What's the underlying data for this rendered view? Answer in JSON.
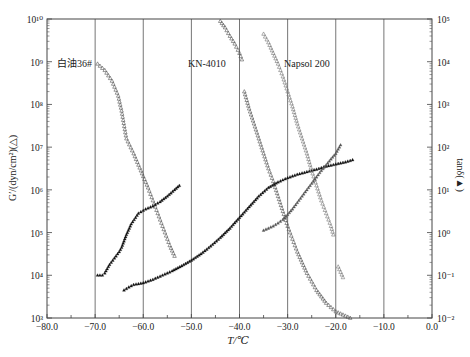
{
  "chart_data": {
    "type": "scatter",
    "title": "",
    "xlabel": "T/℃",
    "ylabel_left": "G′/(dyn/cm²)(△)",
    "ylabel_right": "tanδ(▲)",
    "xlim": [
      -80.0,
      0.0
    ],
    "x_ticks": [
      "-80.0",
      "-70.0",
      "-60.0",
      "-50.0",
      "-40.0",
      "-30.0",
      "-20.0",
      "-10.0",
      "0.0"
    ],
    "ylim_left_log10": [
      3,
      10
    ],
    "y_ticks_left": [
      "10³",
      "10⁴",
      "10⁵",
      "10⁶",
      "10⁷",
      "10⁸",
      "10⁹",
      "10¹⁰"
    ],
    "ylim_right_log10": [
      -2,
      5
    ],
    "y_ticks_right": [
      "10⁻²",
      "10⁻¹",
      "10⁰",
      "10¹",
      "10²",
      "10³",
      "10⁴",
      "10⁵"
    ],
    "grid": "vertical lines at each 10 °C",
    "annotations": [
      {
        "text": "白油36#",
        "x": -78.5,
        "y_log10_left": 9.0
      },
      {
        "text": "KN-4010",
        "x": -48.5,
        "y_log10_left": 9.0
      },
      {
        "text": "Napsol 200",
        "x": -33.5,
        "y_log10_left": 9.0
      }
    ],
    "series": [
      {
        "name": "白油36# G′",
        "axis": "left",
        "marker": "open-triangle",
        "color": "#555555",
        "x": [
          -69.5,
          -68,
          -66.5,
          -65.2,
          -64.5,
          -63.5,
          -62,
          -60.5,
          -59,
          -57.5,
          -56,
          -54.5,
          -53.5
        ],
        "y_log10": [
          8.95,
          8.8,
          8.55,
          8.2,
          7.85,
          7.2,
          6.85,
          6.45,
          6.05,
          5.6,
          5.15,
          4.7,
          4.45
        ]
      },
      {
        "name": "白油36# tanδ",
        "axis": "right",
        "marker": "filled-triangle",
        "color": "#111111",
        "x": [
          -69.5,
          -68.5,
          -68,
          -67,
          -66,
          -65,
          -64.5,
          -63.5,
          -62.5,
          -61,
          -59.5,
          -58,
          -56.5,
          -55,
          -53.5,
          -52.5
        ],
        "y_log10": [
          -1.0,
          -1.0,
          -0.95,
          -0.75,
          -0.6,
          -0.45,
          -0.35,
          -0.05,
          0.2,
          0.45,
          0.55,
          0.62,
          0.72,
          0.85,
          1.0,
          1.1
        ]
      },
      {
        "name": "KN-4010 G′",
        "axis": "left",
        "marker": "open-triangle",
        "color": "#555555",
        "x": [
          -44,
          -43,
          -42,
          -41,
          -40,
          -39.5,
          -39,
          -38,
          -37,
          -36,
          -35,
          -34,
          -33,
          -32,
          -31,
          -30,
          -29,
          -28,
          -27,
          -26,
          -25,
          -24,
          -23,
          -22,
          -21,
          -20,
          -19,
          -18,
          -17
        ],
        "y_log10": [
          9.95,
          9.8,
          9.6,
          9.42,
          9.2,
          9.05,
          8.3,
          7.9,
          7.55,
          7.2,
          6.85,
          6.5,
          6.2,
          5.85,
          5.5,
          5.15,
          4.85,
          4.55,
          4.3,
          4.05,
          3.85,
          3.65,
          3.5,
          3.35,
          3.25,
          3.15,
          3.1,
          3.05,
          3.0
        ]
      },
      {
        "name": "KN-4010 tanδ",
        "axis": "right",
        "marker": "filled-triangle",
        "color": "#111111",
        "x": [
          -64,
          -63,
          -62,
          -61,
          -60,
          -58,
          -56,
          -54,
          -52,
          -50,
          -48,
          -46,
          -44,
          -42,
          -40,
          -38,
          -36,
          -34,
          -32,
          -30,
          -28,
          -26,
          -24,
          -22,
          -20,
          -18,
          -16.5
        ],
        "y_log10": [
          -1.35,
          -1.28,
          -1.22,
          -1.2,
          -1.18,
          -1.1,
          -1.0,
          -0.9,
          -0.78,
          -0.65,
          -0.5,
          -0.32,
          -0.12,
          0.1,
          0.35,
          0.6,
          0.85,
          1.05,
          1.18,
          1.28,
          1.36,
          1.42,
          1.48,
          1.55,
          1.6,
          1.65,
          1.7
        ]
      },
      {
        "name": "Napsol 200 G′",
        "axis": "left",
        "marker": "open-triangle",
        "color": "#777777",
        "x": [
          -35,
          -34,
          -33,
          -32,
          -31,
          -30,
          -29,
          -28,
          -27,
          -26,
          -25,
          -24,
          -23,
          -22,
          -21,
          -20.5,
          -19.5,
          -18.5
        ],
        "y_log10": [
          9.65,
          9.45,
          9.2,
          8.95,
          8.65,
          8.3,
          7.95,
          7.55,
          7.2,
          6.85,
          6.45,
          6.1,
          5.75,
          5.45,
          5.15,
          4.95,
          4.2,
          3.95
        ]
      },
      {
        "name": "Napsol 200 tanδ",
        "axis": "right",
        "marker": "filled-triangle",
        "color": "#555555",
        "x": [
          -35,
          -34,
          -33,
          -32,
          -31,
          -30,
          -29,
          -28,
          -27,
          -26,
          -25,
          -24,
          -23,
          -22,
          -21,
          -20,
          -19.5,
          -19
        ],
        "y_log10": [
          0.05,
          0.1,
          0.15,
          0.22,
          0.3,
          0.42,
          0.55,
          0.7,
          0.85,
          1.0,
          1.15,
          1.3,
          1.45,
          1.58,
          1.72,
          1.85,
          1.95,
          2.05
        ]
      }
    ]
  },
  "labels": {
    "x_axis_title": "T/℃",
    "y_axis_left_title": "G′/(dyn/cm²)(△)",
    "y_axis_right_title": "tanδ(▲)",
    "annotation_baiyou": "白油36#",
    "annotation_kn": "KN-4010",
    "annotation_napsol": "Napsol 200"
  }
}
